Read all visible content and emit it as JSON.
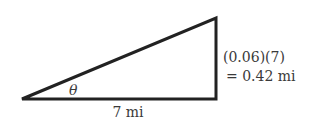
{
  "diagram": {
    "type": "right-triangle",
    "vertices": {
      "left": [
        22,
        99
      ],
      "bottom_right": [
        216,
        99
      ],
      "top_right": [
        216,
        18
      ]
    },
    "stroke_color": "#222222",
    "angle_label": "θ",
    "base_label": "7 mi",
    "height_label_line1": "(0.06)(7)",
    "height_label_line2": "= 0.42 mi"
  }
}
